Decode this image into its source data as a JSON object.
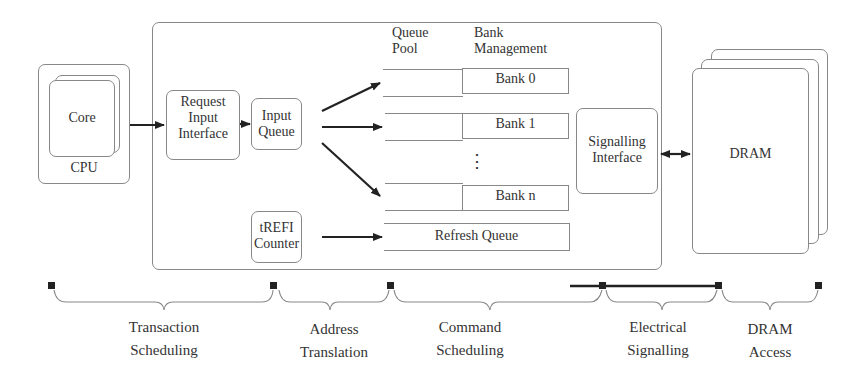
{
  "cpu": {
    "label": "CPU",
    "core_label": "Core"
  },
  "controller": {
    "request_input_interface": [
      "Request",
      "Input",
      "Interface"
    ],
    "input_queue": [
      "Input",
      "Queue"
    ],
    "trefi_counter": [
      "tREFI",
      "Counter"
    ],
    "queue_pool_header": [
      "Queue",
      "Pool"
    ],
    "bank_management_header": [
      "Bank",
      "Management"
    ],
    "banks": [
      "Bank 0",
      "Bank 1",
      "Bank n"
    ],
    "ellipsis": "⋮",
    "refresh_queue": "Refresh Queue",
    "signalling_interface": [
      "Signalling",
      "Interface"
    ]
  },
  "dram": {
    "label": "DRAM"
  },
  "stages": [
    {
      "line1": "Transaction",
      "line2": "Scheduling"
    },
    {
      "line1": "Address",
      "line2": "Translation"
    },
    {
      "line1": "Command",
      "line2": "Scheduling"
    },
    {
      "line1": "Electrical",
      "line2": "Signalling"
    },
    {
      "line1": "DRAM",
      "line2": "Access"
    }
  ],
  "colors": {
    "stroke": "#888888",
    "arrow": "#222222",
    "text": "#333333"
  }
}
